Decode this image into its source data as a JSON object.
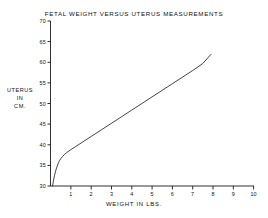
{
  "chart_data": {
    "type": "line",
    "title": "FETAL WEIGHT VERSUS UTERUS MEASUREMENTS",
    "xlabel": "WEIGHT IN LBS.",
    "ylabel": "UTERUS IN CM.",
    "ylabel_lines": [
      "UTERUS",
      "IN",
      "CM."
    ],
    "xlim": [
      0,
      10
    ],
    "ylim": [
      30,
      70
    ],
    "xticks": [
      0,
      1,
      2,
      3,
      4,
      5,
      6,
      7,
      8,
      9,
      10
    ],
    "xtick_labels": [
      "",
      "1",
      "2",
      "3",
      "4",
      "5",
      "6",
      "7",
      "8",
      "9",
      "10"
    ],
    "yticks": [
      30,
      35,
      40,
      45,
      50,
      55,
      60,
      65,
      70
    ],
    "ytick_labels": [
      "30",
      "35",
      "40",
      "45",
      "50",
      "55",
      "60",
      "65",
      "70"
    ],
    "grid": false,
    "legend": null,
    "line_color": "#222222",
    "series": [
      {
        "name": "fetal weight vs uterus measurement",
        "x": [
          0.1,
          0.15,
          0.2,
          0.25,
          0.3,
          0.35,
          0.4,
          0.45,
          0.5,
          0.6,
          0.7,
          0.8,
          1.0,
          1.25,
          1.5,
          2.0,
          2.5,
          3.0,
          3.5,
          4.0,
          4.5,
          5.0,
          5.5,
          6.0,
          6.5,
          7.0,
          7.5,
          7.9
        ],
        "y": [
          30.0,
          31.4,
          32.6,
          33.6,
          34.4,
          35.1,
          35.7,
          36.2,
          36.6,
          37.2,
          37.7,
          38.1,
          38.8,
          39.6,
          40.4,
          42.0,
          43.6,
          45.2,
          46.8,
          48.4,
          50.0,
          51.6,
          53.2,
          54.8,
          56.4,
          58.0,
          59.7,
          61.9
        ]
      }
    ]
  },
  "axes": {
    "ytick_values": [
      "70",
      "65",
      "60",
      "55",
      "50",
      "45",
      "40",
      "35",
      "30"
    ],
    "xtick_values": [
      "1",
      "2",
      "3",
      "4",
      "5",
      "6",
      "7",
      "8",
      "9",
      "10"
    ]
  }
}
